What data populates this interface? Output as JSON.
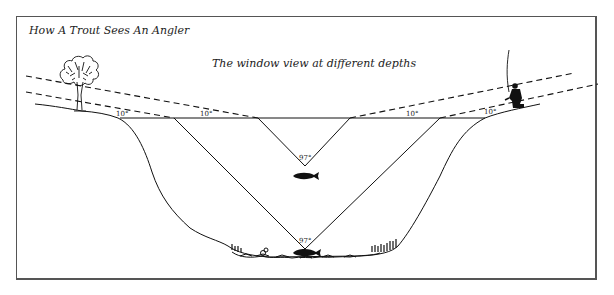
{
  "figure": {
    "title": "How A Trout Sees An Angler",
    "subtitle": "The window view at different depths"
  },
  "labels": {
    "surface_angles": [
      "10°",
      "10°",
      "10°",
      "10°"
    ],
    "window_angle_shallow": "97°",
    "window_angle_deep": "97°"
  },
  "elements": {
    "left_bank_object": "tree-icon",
    "right_bank_object": "angler-icon",
    "fish": [
      "trout-icon-shallow",
      "trout-icon-deep"
    ]
  },
  "colors": {
    "ink": "#111111",
    "frame": "#555555",
    "background": "#ffffff"
  }
}
